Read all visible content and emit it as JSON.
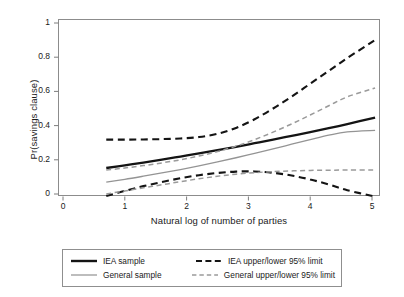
{
  "chart_data": {
    "type": "line",
    "title": "",
    "xlabel": "Natural log of number of parties",
    "ylabel": "Pr(savings clause)",
    "xlim": [
      0,
      5.3
    ],
    "ylim": [
      -0.04,
      1.04
    ],
    "xticks": [
      "0",
      "1",
      "2",
      "3",
      "4",
      "5"
    ],
    "xtick_values": [
      0,
      1,
      2,
      3,
      4,
      5
    ],
    "yticks": [
      "0",
      "0.2",
      "0.4",
      "0.6",
      "0.8",
      "1"
    ],
    "ytick_values": [
      0,
      0.2,
      0.4,
      0.6,
      0.8,
      1
    ],
    "grid": false,
    "legend_position": "below-plot",
    "x": [
      0.7,
      1.0,
      1.3,
      1.6,
      1.9,
      2.2,
      2.5,
      2.8,
      3.1,
      3.4,
      3.7,
      4.0,
      4.3,
      4.6,
      5.05
    ],
    "series": [
      {
        "name": "IEA sample",
        "style": "solid",
        "color": "#141414",
        "width": 2.3,
        "values": [
          0.152,
          0.168,
          0.184,
          0.201,
          0.219,
          0.237,
          0.256,
          0.276,
          0.297,
          0.318,
          0.34,
          0.362,
          0.385,
          0.409,
          0.447
        ]
      },
      {
        "name": "General sample",
        "style": "solid",
        "color": "#949494",
        "width": 1.3,
        "values": [
          0.07,
          0.086,
          0.104,
          0.123,
          0.143,
          0.165,
          0.188,
          0.212,
          0.238,
          0.264,
          0.291,
          0.318,
          0.344,
          0.363,
          0.372
        ]
      },
      {
        "name": "IEA upper/lower 95% limit",
        "style": "dashed",
        "color": "#141414",
        "width": 2.1,
        "bound": "upper",
        "values": [
          0.318,
          0.318,
          0.319,
          0.321,
          0.325,
          0.333,
          0.352,
          0.386,
          0.437,
          0.5,
          0.57,
          0.645,
          0.72,
          0.795,
          0.9
        ]
      },
      {
        "name": "IEA upper/lower 95% limit",
        "style": "dashed",
        "color": "#141414",
        "width": 2.1,
        "bound": "lower",
        "values": [
          -0.012,
          0.018,
          0.046,
          0.07,
          0.092,
          0.11,
          0.123,
          0.131,
          0.132,
          0.124,
          0.108,
          0.085,
          0.056,
          0.022,
          -0.015
        ]
      },
      {
        "name": "General upper/lower 95% limit",
        "style": "dashed",
        "color": "#9a9a9a",
        "width": 1.5,
        "bound": "upper",
        "values": [
          0.14,
          0.152,
          0.166,
          0.182,
          0.2,
          0.222,
          0.248,
          0.28,
          0.318,
          0.362,
          0.41,
          0.462,
          0.516,
          0.568,
          0.62
        ]
      },
      {
        "name": "General upper/lower 95% limit",
        "style": "dashed",
        "color": "#9a9a9a",
        "width": 1.5,
        "bound": "lower",
        "values": [
          0.0,
          0.018,
          0.036,
          0.054,
          0.072,
          0.089,
          0.104,
          0.116,
          0.125,
          0.131,
          0.135,
          0.138,
          0.139,
          0.14,
          0.14
        ]
      }
    ]
  },
  "legend": {
    "rows": [
      {
        "left": {
          "label": "IEA sample",
          "style": "solid",
          "color": "#141414",
          "width": 2.4
        },
        "right": {
          "label": "IEA upper/lower 95% limit",
          "style": "dashed",
          "color": "#141414",
          "width": 2.1
        }
      },
      {
        "left": {
          "label": "General sample",
          "style": "solid",
          "color": "#9a9a9a",
          "width": 1.3
        },
        "right": {
          "label": "General upper/lower 95% limit",
          "style": "dashed",
          "color": "#9a9a9a",
          "width": 1.4
        }
      }
    ]
  },
  "colors": {
    "iea": "#141414",
    "general": "#9a9a9a",
    "frame": "#8c8c8c",
    "text": "#1a1a1a",
    "background": "#ffffff"
  }
}
